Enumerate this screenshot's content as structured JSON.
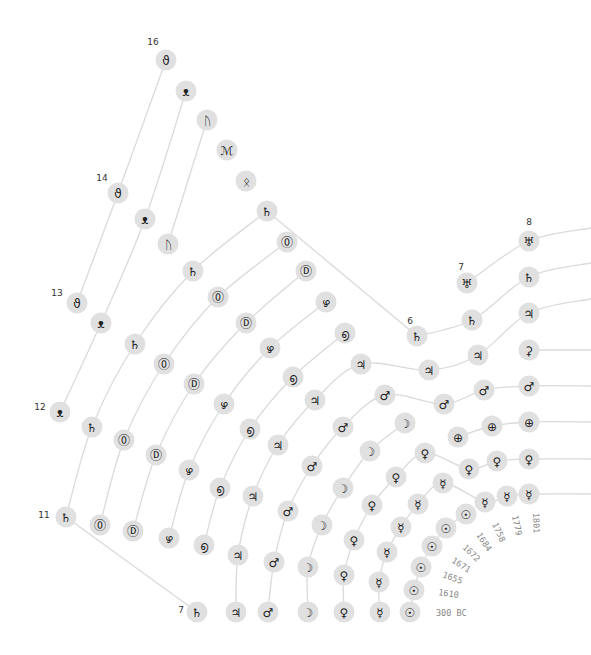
{
  "chart_data": {
    "type": "radial-timeline",
    "title": "",
    "years": [
      "300 BC",
      "1610",
      "1655",
      "1671",
      "1672",
      "1684",
      "1758",
      "1779",
      "1801"
    ],
    "counts": [
      {
        "label": "7",
        "x": 181,
        "y": 613
      },
      {
        "label": "6",
        "x": 410,
        "y": 324
      },
      {
        "label": "7",
        "x": 461,
        "y": 270
      },
      {
        "label": "8",
        "x": 529,
        "y": 225
      },
      {
        "label": "11",
        "x": 44,
        "y": 518
      },
      {
        "label": "12",
        "x": 40,
        "y": 410
      },
      {
        "label": "13",
        "x": 57,
        "y": 296
      },
      {
        "label": "14",
        "x": 102,
        "y": 181
      },
      {
        "label": "16",
        "x": 153,
        "y": 45
      }
    ],
    "year_labels": [
      {
        "text": "300 BC",
        "x": 436,
        "y": 616,
        "rot": 0
      },
      {
        "text": "1610",
        "x": 438,
        "y": 595,
        "rot": 8
      },
      {
        "text": "1655",
        "x": 442,
        "y": 577,
        "rot": 20
      },
      {
        "text": "1671",
        "x": 451,
        "y": 562,
        "rot": 32
      },
      {
        "text": "1672",
        "x": 462,
        "y": 548,
        "rot": 44
      },
      {
        "text": "1684",
        "x": 476,
        "y": 535,
        "rot": 56
      },
      {
        "text": "1758",
        "x": 492,
        "y": 524,
        "rot": 66
      },
      {
        "text": "1779",
        "x": 512,
        "y": 516,
        "rot": 78
      },
      {
        "text": "1801",
        "x": 533,
        "y": 513,
        "rot": 88
      }
    ],
    "series": [
      {
        "name": "Sun",
        "glyph": "☉",
        "points": [
          [
            410,
            612
          ],
          [
            414,
            590
          ],
          [
            421,
            567
          ],
          [
            432,
            546
          ],
          [
            446,
            528
          ],
          [
            466,
            514
          ]
        ],
        "tail": null
      },
      {
        "name": "Mercury",
        "glyph": "☿",
        "points": [
          [
            380,
            612
          ],
          [
            379,
            582
          ],
          [
            387,
            552
          ],
          [
            401,
            527
          ],
          [
            418,
            504
          ],
          [
            443,
            483
          ],
          [
            485,
            502
          ],
          [
            507,
            496
          ],
          [
            529,
            494
          ]
        ],
        "tail": [
          591,
          494
        ]
      },
      {
        "name": "Venus",
        "glyph": "♀",
        "points": [
          [
            344,
            612
          ],
          [
            344,
            575
          ],
          [
            354,
            540
          ],
          [
            372,
            505
          ],
          [
            396,
            477
          ],
          [
            425,
            453
          ],
          [
            469,
            469
          ],
          [
            497,
            461
          ],
          [
            529,
            459
          ]
        ],
        "tail": [
          591,
          459
        ]
      },
      {
        "name": "Earth",
        "glyph": "⊕",
        "points": [
          [
            458,
            437
          ],
          [
            492,
            426
          ],
          [
            529,
            422
          ]
        ],
        "tail": [
          591,
          422
        ]
      },
      {
        "name": "Moon",
        "glyph": "☽",
        "points": [
          [
            308,
            612
          ],
          [
            308,
            567
          ],
          [
            322,
            525
          ],
          [
            343,
            488
          ],
          [
            370,
            451
          ],
          [
            405,
            423
          ]
        ],
        "tail": null
      },
      {
        "name": "Mars",
        "glyph": "♂",
        "points": [
          [
            268,
            612
          ],
          [
            274,
            562
          ],
          [
            288,
            511
          ],
          [
            312,
            466
          ],
          [
            343,
            427
          ],
          [
            385,
            395
          ],
          [
            444,
            404
          ],
          [
            484,
            390
          ],
          [
            529,
            386
          ]
        ],
        "tail": [
          591,
          386
        ]
      },
      {
        "name": "Ceres",
        "glyph": "⚳",
        "points": [
          [
            529,
            350
          ]
        ],
        "tail": [
          591,
          350
        ]
      },
      {
        "name": "Jupiter",
        "glyph": "♃",
        "points": [
          [
            236,
            612
          ],
          [
            238,
            555
          ],
          [
            253,
            496
          ],
          [
            278,
            445
          ],
          [
            315,
            400
          ],
          [
            361,
            364
          ],
          [
            429,
            370
          ],
          [
            478,
            355
          ],
          [
            529,
            313
          ]
        ],
        "tail": [
          591,
          299
        ]
      },
      {
        "name": "Saturn",
        "glyph": "♄",
        "points": [
          [
            197,
            612
          ],
          [
            66,
            517
          ],
          [
            92,
            427
          ],
          [
            135,
            344
          ],
          [
            193,
            271
          ],
          [
            267,
            211
          ],
          [
            417,
            336
          ],
          [
            472,
            320
          ],
          [
            529,
            277
          ]
        ],
        "tail": [
          591,
          263
        ],
        "straight_first": true
      },
      {
        "name": "Uranus",
        "glyph": "♅",
        "points": [
          [
            467,
            283
          ],
          [
            529,
            241
          ]
        ],
        "tail": [
          591,
          228
        ]
      },
      {
        "name": "Io",
        "glyph": "⓪",
        "points": [
          [
            100,
            525
          ],
          [
            124,
            440
          ],
          [
            164,
            364
          ],
          [
            218,
            297
          ],
          [
            287,
            242
          ]
        ],
        "tail": null
      },
      {
        "name": "Europa",
        "glyph": "Ⓓ",
        "points": [
          [
            133,
            531
          ],
          [
            156,
            455
          ],
          [
            194,
            384
          ],
          [
            246,
            323
          ],
          [
            306,
            271
          ]
        ],
        "tail": null
      },
      {
        "name": "Ganymede",
        "glyph": "ഴ",
        "points": [
          [
            169,
            538
          ],
          [
            189,
            470
          ],
          [
            224,
            404
          ],
          [
            270,
            348
          ],
          [
            326,
            302
          ]
        ],
        "tail": null
      },
      {
        "name": "Callisto",
        "glyph": "൭",
        "points": [
          [
            204,
            545
          ],
          [
            220,
            488
          ],
          [
            250,
            429
          ],
          [
            293,
            377
          ],
          [
            345,
            333
          ]
        ],
        "tail": null
      },
      {
        "name": "Titan",
        "glyph": "T",
        "points": [
          [
            60,
            412
          ],
          [
            101,
            323
          ],
          [
            145,
            219
          ],
          [
            186,
            91
          ]
        ],
        "tail": null
      },
      {
        "name": "Iapetus",
        "glyph": "I",
        "points": [
          [
            77,
            303
          ],
          [
            118,
            193
          ],
          [
            166,
            60
          ]
        ],
        "tail": null
      },
      {
        "name": "Rhea",
        "glyph": "R",
        "points": [
          [
            168,
            244
          ],
          [
            207,
            120
          ]
        ],
        "tail": null
      },
      {
        "name": "Tethys",
        "glyph": "t",
        "points": [
          [
            227,
            150
          ]
        ],
        "tail": null
      },
      {
        "name": "Dione",
        "glyph": "d",
        "points": [
          [
            246,
            181
          ]
        ],
        "tail": null
      }
    ]
  },
  "glyphs": {
    "Titan": "ᴥ",
    "Iapetus": "ϑ",
    "Rhea": "ᚢ",
    "Tethys": "ℳ",
    "Dione": "ᛟ"
  }
}
